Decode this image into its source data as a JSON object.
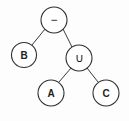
{
  "diagram": {
    "type": "expression-tree",
    "nodes": [
      {
        "id": "root",
        "label": "−",
        "kind": "operator",
        "cx": 54,
        "cy": 20,
        "r": 13
      },
      {
        "id": "b",
        "label": "B",
        "kind": "operand",
        "cx": 24,
        "cy": 55,
        "r": 12.5
      },
      {
        "id": "union",
        "label": "∪",
        "kind": "operator",
        "cx": 79,
        "cy": 58,
        "r": 13
      },
      {
        "id": "a",
        "label": "A",
        "kind": "operand",
        "cx": 51,
        "cy": 93,
        "r": 13
      },
      {
        "id": "c",
        "label": "C",
        "kind": "operand",
        "cx": 106,
        "cy": 93,
        "r": 13
      }
    ],
    "edges": [
      {
        "from": "root",
        "to": "b"
      },
      {
        "from": "root",
        "to": "union"
      },
      {
        "from": "union",
        "to": "a"
      },
      {
        "from": "union",
        "to": "c"
      }
    ],
    "colors": {
      "stroke": "#2e2e2e",
      "fill": "#ffffff",
      "text": "#222222",
      "background": "#fdfdfd"
    }
  }
}
